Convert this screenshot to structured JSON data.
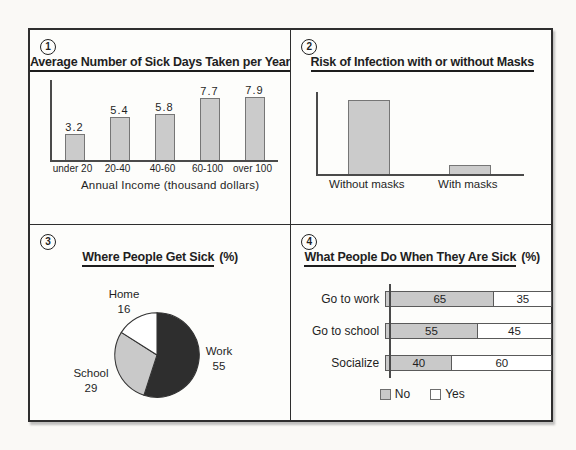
{
  "panels": [
    {
      "number": "1",
      "title": "Average Number of Sick Days Taken per Year",
      "xlabel": "Annual Income (thousand dollars)"
    },
    {
      "number": "2",
      "title": "Risk of Infection with or without Masks"
    },
    {
      "number": "3",
      "title": "Where People Get Sick",
      "title_suffix": "(%)"
    },
    {
      "number": "4",
      "title": "What People Do When They Are Sick",
      "title_suffix": "(%)"
    }
  ],
  "chart_data": [
    {
      "type": "bar",
      "title": "Average Number of Sick Days Taken per Year",
      "categories": [
        "under 20",
        "20-40",
        "40-60",
        "60-100",
        "over 100"
      ],
      "values": [
        3.2,
        5.4,
        5.8,
        7.7,
        7.9
      ],
      "value_labels": true,
      "xlabel": "Annual Income (thousand dollars)",
      "ylabel": "",
      "ylim": [
        0,
        10
      ],
      "bar_color": "#cbcbcb"
    },
    {
      "type": "bar",
      "title": "Risk of Infection with or without Masks",
      "categories": [
        "Without masks",
        "With masks"
      ],
      "values": [
        90,
        11
      ],
      "value_labels": false,
      "ylim": [
        0,
        100
      ],
      "bar_color": "#cbcbcb"
    },
    {
      "type": "pie",
      "title": "Where People Get Sick (%)",
      "start_angle_deg": 0,
      "clockwise": true,
      "slices": [
        {
          "label": "Work",
          "value": 55,
          "color": "#2e2e2e"
        },
        {
          "label": "School",
          "value": 29,
          "color": "#c9c9c9"
        },
        {
          "label": "Home",
          "value": 16,
          "color": "#ffffff"
        }
      ]
    },
    {
      "type": "bar",
      "subtype": "horizontal-stacked",
      "title": "What People Do When They Are Sick (%)",
      "categories": [
        "Go to work",
        "Go to school",
        "Socialize"
      ],
      "series": [
        {
          "name": "No",
          "color": "#c9c9c9",
          "values": [
            65,
            55,
            40
          ]
        },
        {
          "name": "Yes",
          "color": "#ffffff",
          "values": [
            35,
            45,
            60
          ]
        }
      ],
      "xlim": [
        0,
        100
      ],
      "legend_position": "bottom"
    }
  ]
}
